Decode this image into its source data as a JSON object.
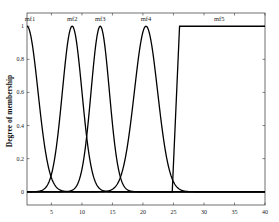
{
  "chart_data": {
    "type": "line",
    "title": "",
    "xlabel": "",
    "ylabel": "Degree of membership",
    "xlim": [
      1,
      40
    ],
    "ylim": [
      -0.08,
      1.08
    ],
    "grid": false,
    "legend": "none",
    "xticks": [
      5,
      10,
      15,
      20,
      25,
      30,
      35,
      40
    ],
    "xtick_labels": [
      "5",
      "10",
      "15",
      "20",
      "25",
      "30",
      "35",
      "40"
    ],
    "yticks": [
      0,
      0.2,
      0.4,
      0.6,
      0.8,
      1
    ],
    "ytick_labels": [
      "0",
      "0.2",
      "0.4",
      "0.6",
      "0.8",
      "1"
    ],
    "series": [
      {
        "name": "mf1",
        "shape": "gaussian",
        "center": 1,
        "sigma": 1.8,
        "label_x": 1.5
      },
      {
        "name": "mf2",
        "shape": "gaussian",
        "center": 8.4,
        "sigma": 1.6,
        "label_x": 8.4
      },
      {
        "name": "mf3",
        "shape": "gaussian",
        "center": 13,
        "sigma": 1.5,
        "label_x": 13
      },
      {
        "name": "mf4",
        "shape": "gaussian",
        "center": 20.5,
        "sigma": 1.9,
        "label_x": 20.5
      },
      {
        "name": "mf5",
        "shape": "ramp",
        "start": 24.8,
        "end": 26,
        "label_x": 32.5
      }
    ],
    "line_color": "#000000"
  }
}
